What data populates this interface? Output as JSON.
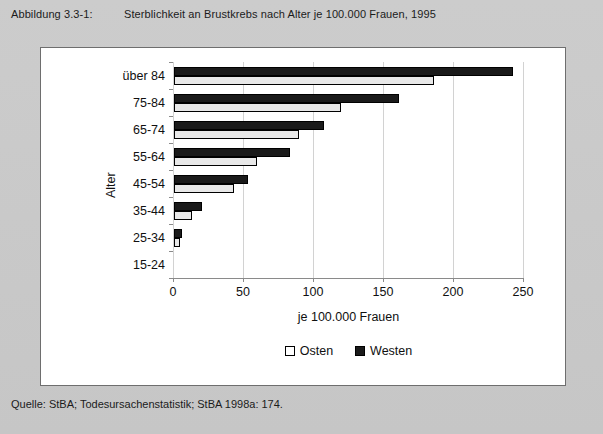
{
  "caption": {
    "figure_label": "Abbildung 3.3-1:",
    "title": "Sterblichkeit an Brustkrebs nach Alter je 100.000 Frauen, 1995"
  },
  "source": {
    "text": "Quelle: StBA; Todesursachenstatistik; StBA 1998a: 174."
  },
  "legend": {
    "position": "bottom-center",
    "items": [
      {
        "label": "Osten",
        "color": "#ffffff"
      },
      {
        "label": "Westen",
        "color": "#1a1a1a"
      }
    ]
  },
  "axes": {
    "y_title": "Alter",
    "x_title": "je 100.000 Frauen",
    "x_ticks": [
      "0",
      "50",
      "100",
      "150",
      "200",
      "250"
    ]
  },
  "chart_data": {
    "type": "bar",
    "orientation": "horizontal",
    "title": "Sterblichkeit an Brustkrebs nach Alter je 100.000 Frauen, 1995",
    "xlabel": "je 100.000 Frauen",
    "ylabel": "Alter",
    "xlim": [
      0,
      250
    ],
    "xticks": [
      0,
      50,
      100,
      150,
      200,
      250
    ],
    "grid": true,
    "legend_position": "bottom-center",
    "categories": [
      "über 84",
      "75-84",
      "65-74",
      "55-64",
      "45-54",
      "35-44",
      "25-34",
      "15-24"
    ],
    "series": [
      {
        "name": "Osten",
        "color": "#ffffff",
        "values": [
          186,
          119,
          89,
          59,
          43,
          13,
          4,
          0
        ]
      },
      {
        "name": "Westen",
        "color": "#1a1a1a",
        "values": [
          242,
          161,
          107,
          83,
          53,
          20,
          6,
          0
        ]
      }
    ]
  }
}
